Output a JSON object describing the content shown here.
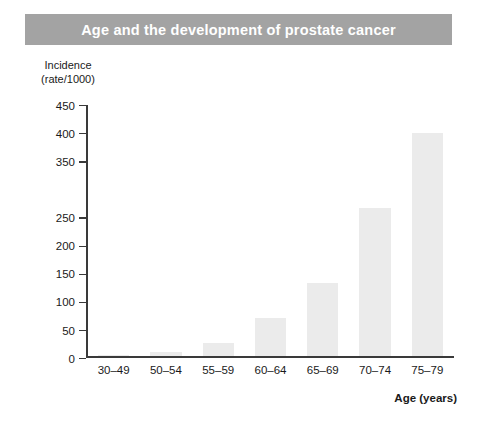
{
  "chart_data": {
    "type": "bar",
    "title": "Age and the development of prostate cancer",
    "xlabel": "Age (years)",
    "ylabel": "Incidence (rate/1000)",
    "ylabel_line1": "Incidence",
    "ylabel_line2": "(rate/1000)",
    "categories": [
      "30–49",
      "50–54",
      "55–59",
      "60–64",
      "65–69",
      "70–74",
      "75–79"
    ],
    "values": [
      2,
      7,
      24,
      68,
      132,
      265,
      400
    ],
    "ylim": [
      0,
      450
    ],
    "ytick_values": [
      0,
      50,
      100,
      150,
      200,
      250,
      350,
      400,
      450
    ],
    "ytick_labels": [
      "0",
      "50",
      "100",
      "150",
      "200",
      "250",
      "350",
      "400",
      "450"
    ],
    "grid": false,
    "legend": "none",
    "bar_color": "#ebebeb",
    "axis_color": "#3a3a3a",
    "banner_color": "#a3a3a3",
    "title_color": "#ffffff"
  }
}
